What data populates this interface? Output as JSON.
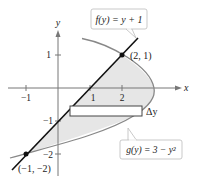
{
  "figure": {
    "axes": {
      "x_label": "x",
      "y_label": "y",
      "x_ticks": [
        {
          "value": -1,
          "label": "−1"
        },
        {
          "value": 1,
          "label": "1"
        },
        {
          "value": 2,
          "label": "2"
        }
      ],
      "y_ticks": [
        {
          "value": 1,
          "label": "1"
        },
        {
          "value": -1,
          "label": "−1"
        },
        {
          "value": -2,
          "label": "−2"
        }
      ]
    },
    "curves": {
      "line": {
        "label": "f(y) = y + 1",
        "color": "#111111"
      },
      "parabola": {
        "label": "g(y) = 3 − y²",
        "color": "#888888"
      }
    },
    "points": [
      {
        "label": "(2, 1)",
        "x": 2,
        "y": 1
      },
      {
        "label": "(−1, −2)",
        "x": -1,
        "y": -2
      }
    ],
    "rectangle": {
      "label": "Δy"
    },
    "colors": {
      "region_fill": "#e6e6e6",
      "axis": "#777777",
      "label_box_border": "#bbbbbb"
    }
  }
}
